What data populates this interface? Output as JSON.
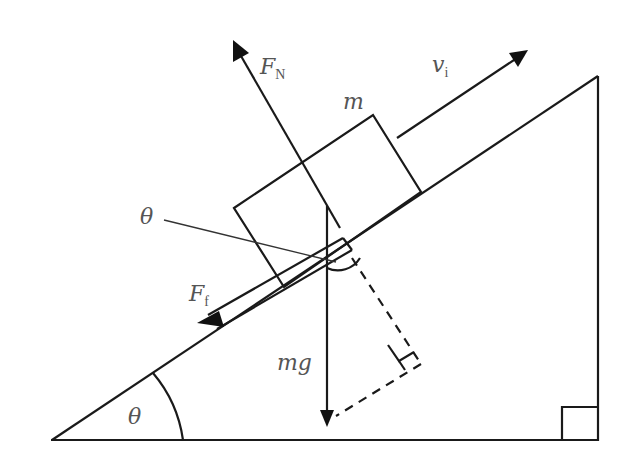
{
  "diagram": {
    "labels": {
      "normal_force": {
        "main": "F",
        "sub": "N"
      },
      "initial_velocity": {
        "main": "v",
        "sub": "i"
      },
      "mass": "m",
      "friction_force": {
        "main": "F",
        "sub": "f"
      },
      "weight": "mg",
      "angle_at_block": "θ",
      "angle_at_base": "θ"
    },
    "colors": {
      "line": "#1a1a1a",
      "label": "#555555",
      "background": "#ffffff"
    }
  }
}
